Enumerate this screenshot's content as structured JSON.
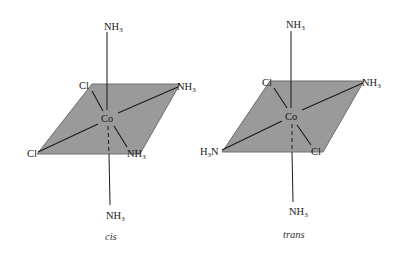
{
  "colors": {
    "plane_fill": "#9a9a9a",
    "plane_stroke": "#6e6e6e",
    "bond": "#1a1a1a",
    "background": "#ffffff"
  },
  "isomers": [
    {
      "caption": "cis",
      "center": "Co",
      "ligands": {
        "top": {
          "base": "NH",
          "sub": "3"
        },
        "bottom": {
          "base": "NH",
          "sub": "3"
        },
        "back_left": {
          "base": "Cl",
          "sub": ""
        },
        "back_right": {
          "base": "NH",
          "sub": "3"
        },
        "front_left": {
          "base": "Cl",
          "sub": ""
        },
        "front_right": {
          "base": "NH",
          "sub": "3"
        }
      }
    },
    {
      "caption": "trans",
      "center": "Co",
      "ligands": {
        "top": {
          "base": "NH",
          "sub": "3"
        },
        "bottom": {
          "base": "NH",
          "sub": "3"
        },
        "back_left": {
          "base": "Cl",
          "sub": ""
        },
        "back_right": {
          "base": "NH",
          "sub": "3"
        },
        "front_left": {
          "pre": "H",
          "sub": "3",
          "post": "N"
        },
        "front_right": {
          "base": "Cl",
          "sub": ""
        }
      }
    }
  ]
}
